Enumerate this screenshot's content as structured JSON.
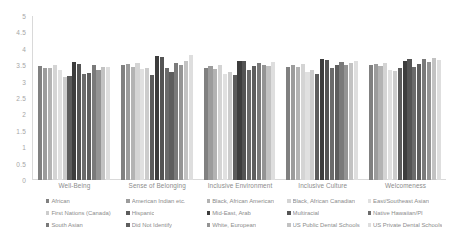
{
  "chart_data": {
    "type": "bar",
    "title": "",
    "xlabel": "",
    "ylabel": "",
    "ylim": [
      0,
      5
    ],
    "ytick_labels": [
      "5",
      "4.5",
      "4",
      "3.5",
      "3",
      "2.5",
      "2",
      "1.5",
      "1",
      "0.5",
      "0"
    ],
    "ytick_values": [
      5,
      4.5,
      4,
      3.5,
      3,
      2.5,
      2,
      1.5,
      1,
      0.5,
      0
    ],
    "grid": false,
    "legend_position": "bottom",
    "categories": [
      "Well-Being",
      "Sense of Belonging",
      "Inclusive Environment",
      "Inclusive Culture",
      "Welcomeness"
    ],
    "series": [
      {
        "name": "African",
        "color": "#808080",
        "values": [
          3.47,
          3.5,
          3.42,
          3.46,
          3.5
        ]
      },
      {
        "name": "American Indian etc.",
        "color": "#9c9c9c",
        "values": [
          3.4,
          3.53,
          3.48,
          3.52,
          3.55
        ]
      },
      {
        "name": "Black, African American",
        "color": "#b3b3b3",
        "values": [
          3.4,
          3.45,
          3.38,
          3.44,
          3.48
        ]
      },
      {
        "name": "Black, African Canadian",
        "color": "#d4d4d4",
        "values": [
          3.5,
          3.58,
          3.52,
          3.55,
          3.58
        ]
      },
      {
        "name": "East/Southeast Asian",
        "color": "#e0e0e0",
        "values": [
          3.35,
          3.38,
          3.22,
          3.3,
          3.34
        ]
      },
      {
        "name": "First Nations (Canada)",
        "color": "#cccccc",
        "values": [
          3.15,
          3.4,
          3.3,
          3.35,
          3.32
        ]
      },
      {
        "name": "Hispanic",
        "color": "#5c5c5c",
        "values": [
          3.18,
          3.2,
          3.2,
          3.22,
          3.4
        ]
      },
      {
        "name": "Mid-East, Arab",
        "color": "#3d3d3d",
        "values": [
          3.6,
          3.78,
          3.62,
          3.7,
          3.62
        ]
      },
      {
        "name": "Multiracial",
        "color": "#545454",
        "values": [
          3.53,
          3.75,
          3.62,
          3.65,
          3.68
        ]
      },
      {
        "name": "Native Hawaiian/PI",
        "color": "#6b6b6b",
        "values": [
          3.22,
          3.42,
          3.35,
          3.4,
          3.45
        ]
      },
      {
        "name": "Did Not Identify",
        "color": "#5e5e5e",
        "values": [
          3.26,
          3.3,
          3.48,
          3.52,
          3.55
        ]
      },
      {
        "name": "South Asian",
        "color": "#7a7a7a",
        "values": [
          3.52,
          3.58,
          3.58,
          3.6,
          3.68
        ]
      },
      {
        "name": "White, European",
        "color": "#949494",
        "values": [
          3.36,
          3.5,
          3.52,
          3.52,
          3.6
        ]
      },
      {
        "name": "US Public Dental Schools",
        "color": "#c2c2c2",
        "values": [
          3.46,
          3.62,
          3.48,
          3.58,
          3.72
        ]
      },
      {
        "name": "US Private Dental Schools",
        "color": "#dedede",
        "values": [
          3.44,
          3.8,
          3.6,
          3.64,
          3.66
        ]
      }
    ]
  },
  "legend": {
    "items": [
      {
        "label": "African",
        "color": "#808080"
      },
      {
        "label": "American Indian etc.",
        "color": "#9c9c9c"
      },
      {
        "label": "Black, African American",
        "color": "#b3b3b3"
      },
      {
        "label": "Black, African Canadian",
        "color": "#d4d4d4"
      },
      {
        "label": "East/Southeast Asian",
        "color": "#e0e0e0"
      },
      {
        "label": "First Nations (Canada)",
        "color": "#cccccc"
      },
      {
        "label": "Hispanic",
        "color": "#5c5c5c"
      },
      {
        "label": "Mid-East, Arab",
        "color": "#3d3d3d"
      },
      {
        "label": "Multiracial",
        "color": "#545454"
      },
      {
        "label": "Native Hawaiian/PI",
        "color": "#6b6b6b"
      },
      {
        "label": "South Asian",
        "color": "#7a7a7a"
      },
      {
        "label": "Did Not Identify",
        "color": "#5e5e5e"
      },
      {
        "label": "White, European",
        "color": "#949494"
      },
      {
        "label": "US Public Dental Schools",
        "color": "#c2c2c2"
      },
      {
        "label": "US Private Dental Schools",
        "color": "#dedede"
      }
    ]
  }
}
